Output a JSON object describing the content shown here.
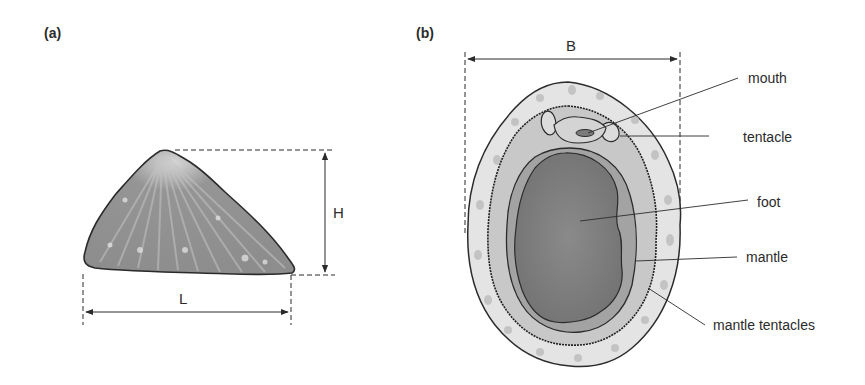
{
  "figure": {
    "panel_a": {
      "label": "(a)",
      "title": "limpet shell side view",
      "dimensions": {
        "length_label": "L",
        "height_label": "H"
      }
    },
    "panel_b": {
      "label": "(b)",
      "title": "limpet underside view",
      "dimensions": {
        "breadth_label": "B"
      },
      "parts": [
        {
          "id": "mouth",
          "label": "mouth"
        },
        {
          "id": "tentacle",
          "label": "tentacle"
        },
        {
          "id": "foot",
          "label": "foot"
        },
        {
          "id": "mantle",
          "label": "mantle"
        },
        {
          "id": "mantle-tentacles",
          "label": "mantle tentacles"
        }
      ]
    },
    "colors": {
      "ink": "#2b2b2b",
      "shell_fill": "#8a8a8a",
      "foot_fill": "#7d7d7d",
      "mantle_fill": "#a9a9a9",
      "rim_fill": "#e6e6e6"
    }
  }
}
